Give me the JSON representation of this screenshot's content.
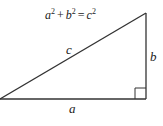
{
  "diagram": {
    "formula": {
      "a": "a",
      "plus": "+",
      "b": "b",
      "equals": "=",
      "c": "c",
      "exponent": "2"
    },
    "labels": {
      "hypotenuse": "c",
      "vertical_leg": "b",
      "horizontal_leg": "a"
    },
    "colors": {
      "stroke": "#333333",
      "text": "#222222",
      "background": "#ffffff"
    }
  }
}
